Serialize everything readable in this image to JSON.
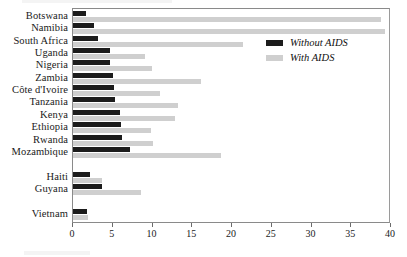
{
  "chart_data": {
    "type": "bar",
    "orientation": "horizontal",
    "title": "",
    "xlabel": "",
    "ylabel": "",
    "xlim": [
      0,
      40
    ],
    "xticks": [
      0,
      5,
      10,
      15,
      20,
      25,
      30,
      35,
      40
    ],
    "grid": false,
    "legend_position": "upper-right-inside",
    "categories": [
      "Botswana",
      "Namibia",
      "South Africa",
      "Uganda",
      "Nigeria",
      "Zambia",
      "Côte d'Ivoire",
      "Tanzania",
      "Kenya",
      "Ethiopia",
      "Rwanda",
      "Mozambique",
      "",
      "Haiti",
      "Guyana",
      "",
      "Vietnam"
    ],
    "series": [
      {
        "name": "Without AIDS",
        "color": "#1c1c1c",
        "values": [
          1.6,
          2.6,
          3.2,
          4.6,
          4.6,
          5.0,
          5.2,
          5.3,
          5.9,
          6.0,
          6.2,
          7.2,
          null,
          2.1,
          3.6,
          null,
          1.7
        ]
      },
      {
        "name": "With AIDS",
        "color": "#cfcfcf",
        "values": [
          38.8,
          39.3,
          21.4,
          9.1,
          9.9,
          16.1,
          11.0,
          13.2,
          12.8,
          9.8,
          10.1,
          18.6,
          null,
          3.6,
          8.6,
          null,
          1.9
        ]
      }
    ]
  },
  "legend": {
    "items": [
      {
        "label": "Without AIDS",
        "color": "#1c1c1c"
      },
      {
        "label": "With AIDS",
        "color": "#cfcfcf"
      }
    ]
  },
  "axis": {
    "tick_labels": [
      "0",
      "5",
      "10",
      "15",
      "20",
      "25",
      "30",
      "35",
      "40"
    ]
  }
}
